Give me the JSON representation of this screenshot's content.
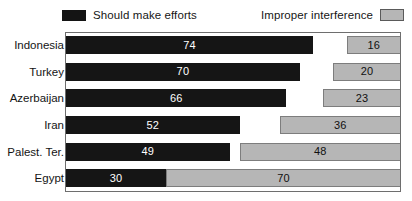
{
  "legend": {
    "position": "top",
    "entries": [
      {
        "label": "Should make efforts",
        "swatch": "dark-swatch-icon",
        "color": "#151515"
      },
      {
        "label": "Improper interference",
        "swatch": "gray-swatch-icon",
        "color": "#b6b6b6"
      }
    ]
  },
  "chart_data": {
    "type": "bar",
    "orientation": "horizontal",
    "stacked": true,
    "title": "",
    "subtitle": "",
    "xlabel": "",
    "ylabel": "",
    "xlim": [
      0,
      100
    ],
    "grid": false,
    "legend_position": "top",
    "categories": [
      "Indonesia",
      "Turkey",
      "Azerbaijan",
      "Iran",
      "Palest. Ter.",
      "Egypt"
    ],
    "series": [
      {
        "name": "Should make efforts",
        "color": "#151515",
        "values": [
          74,
          70,
          66,
          52,
          49,
          30
        ]
      },
      {
        "name": "Improper interference",
        "color": "#b6b6b6",
        "values": [
          16,
          20,
          23,
          36,
          48,
          70
        ]
      }
    ],
    "rows": [
      {
        "category": "Indonesia",
        "efforts": 74,
        "interference": 16
      },
      {
        "category": "Turkey",
        "efforts": 70,
        "interference": 20
      },
      {
        "category": "Azerbaijan",
        "efforts": 66,
        "interference": 23
      },
      {
        "category": "Iran",
        "efforts": 52,
        "interference": 36
      },
      {
        "category": "Palest. Ter.",
        "efforts": 49,
        "interference": 48
      },
      {
        "category": "Egypt",
        "efforts": 30,
        "interference": 70
      }
    ]
  }
}
